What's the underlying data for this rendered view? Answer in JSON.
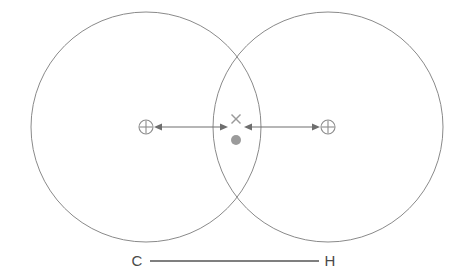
{
  "figure": {
    "background_color": "#ffffff",
    "width": 464,
    "height": 277
  },
  "colors": {
    "circle_stroke": "#8a8a8a",
    "arrow_stroke": "#6e6e6e",
    "marker_stroke": "#8d8d8d",
    "center_dot_fill": "#9b9b9b",
    "x_marker_stroke": "#9a9a9a",
    "bond_line_stroke": "#555555",
    "label_text": "#4a4a4a"
  },
  "circles": [
    {
      "name": "carbon-sphere",
      "cx": 146,
      "cy": 127,
      "r": 115
    },
    {
      "name": "hydrogen-sphere",
      "cx": 328,
      "cy": 127,
      "r": 115
    }
  ],
  "nucleus_markers": [
    {
      "name": "carbon-nucleus",
      "symbol": "circled-plus",
      "cx": 146,
      "cy": 127,
      "r": 7
    },
    {
      "name": "hydrogen-nucleus",
      "symbol": "circled-plus",
      "cx": 328,
      "cy": 127,
      "r": 7
    }
  ],
  "center_markers": [
    {
      "name": "overlap-cross",
      "symbol": "x-mark",
      "cx": 236,
      "cy": 119,
      "size": 5
    },
    {
      "name": "overlap-dot",
      "symbol": "filled-dot",
      "cx": 236,
      "cy": 140,
      "r": 5
    }
  ],
  "arrows": [
    {
      "name": "carbon-radius-arrow",
      "x1": 154,
      "x2": 228,
      "y": 127,
      "double_headed": true
    },
    {
      "name": "hydrogen-radius-arrow",
      "x1": 244,
      "x2": 320,
      "y": 127,
      "double_headed": true
    }
  ],
  "bond": {
    "name": "c-h-bond",
    "left_label": "C",
    "right_label": "H",
    "line_x1": 150,
    "line_x2": 319,
    "line_y": 261,
    "left_label_x": 137,
    "right_label_x": 330,
    "label_y": 266
  }
}
